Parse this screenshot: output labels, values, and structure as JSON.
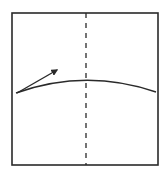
{
  "diagram": {
    "type": "origami-fold-step",
    "background": "#ffffff",
    "stroke_color": "#2a2a2a",
    "square": {
      "x": 12,
      "y": 13,
      "width": 146,
      "height": 152,
      "stroke_width": 1.6
    },
    "fold_line": {
      "style": "dashed",
      "x": 86,
      "y1": 13,
      "y2": 165,
      "dash": "5,5"
    },
    "curve": {
      "start": [
        16,
        93
      ],
      "control": [
        86,
        68
      ],
      "end": [
        156,
        92
      ]
    },
    "arrow": {
      "from": [
        17,
        93
      ],
      "to": [
        57,
        70
      ],
      "label": "fold-direction"
    }
  }
}
